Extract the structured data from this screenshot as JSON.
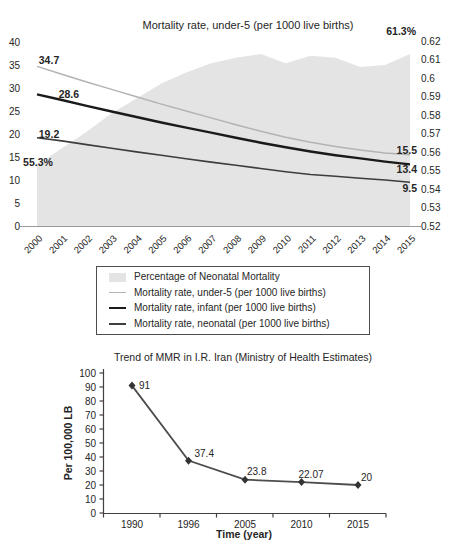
{
  "chart_data": [
    {
      "type": "area",
      "title": "Mortality rate, under-5 (per 1000 live births)",
      "x": [
        "2000",
        "2001",
        "2002",
        "2003",
        "2004",
        "2005",
        "2006",
        "2007",
        "2008",
        "2009",
        "2010",
        "2011",
        "2012",
        "2013",
        "2014",
        "2015"
      ],
      "left_axis": {
        "min": 0,
        "max": 40,
        "ticks": [
          "0",
          "5",
          "10",
          "15",
          "20",
          "25",
          "30",
          "35",
          "40"
        ]
      },
      "right_axis": {
        "min": 0.52,
        "max": 0.62,
        "ticks": [
          "0.52",
          "0.53",
          "0.54",
          "0.55",
          "0.56",
          "0.57",
          "0.58",
          "0.59",
          "0.6",
          "0.61",
          "0.62"
        ]
      },
      "grid": false,
      "area_series": {
        "name": "Percentage of Neonatal Mortality",
        "axis": "right",
        "color": "#e4e4e4",
        "values": [
          0.553,
          0.562,
          0.571,
          0.581,
          0.589,
          0.597,
          0.603,
          0.608,
          0.611,
          0.613,
          0.608,
          0.612,
          0.611,
          0.606,
          0.607,
          0.613
        ],
        "start_label": "55.3%",
        "end_label": "61.3%"
      },
      "line_series": [
        {
          "name": "Mortality rate, under-5 (per 1000 live births)",
          "axis": "left",
          "color": "#b3b3b3",
          "width": 1.5,
          "values": [
            34.7,
            33.0,
            31.3,
            29.7,
            28.1,
            26.5,
            25.0,
            23.5,
            22.0,
            20.6,
            19.3,
            18.2,
            17.3,
            16.5,
            15.9,
            15.5
          ],
          "start_label": "34.7",
          "end_label": "15.5"
        },
        {
          "name": "Mortality rate, infant (per 1000 live births)",
          "axis": "left",
          "color": "#1a1a1a",
          "width": 2.4,
          "values": [
            28.6,
            27.4,
            26.1,
            24.9,
            23.7,
            22.5,
            21.4,
            20.3,
            19.2,
            18.1,
            17.1,
            16.2,
            15.4,
            14.7,
            14.0,
            13.4
          ],
          "start_label": "28.6",
          "end_label": "13.4"
        },
        {
          "name": "Mortality rate, neonatal (per 1000 live births)",
          "axis": "left",
          "color": "#3d3d3d",
          "width": 1.6,
          "values": [
            19.2,
            18.5,
            17.7,
            16.9,
            16.1,
            15.4,
            14.6,
            13.9,
            13.2,
            12.5,
            11.8,
            11.2,
            10.8,
            10.4,
            10.0,
            9.5
          ],
          "start_label": "19.2",
          "end_label": "9.5"
        }
      ],
      "legend": {
        "position": "bottom",
        "items": [
          {
            "label": "Percentage of Neonatal Mortality",
            "swatch": "area",
            "color": "#e4e4e4"
          },
          {
            "label": "Mortality rate, under-5 (per 1000 live births)",
            "swatch": "line",
            "color": "#b3b3b3",
            "line_width": 1.5
          },
          {
            "label": "Mortality rate, infant (per 1000 live births)",
            "swatch": "line",
            "color": "#1a1a1a",
            "line_width": 2.5
          },
          {
            "label": "Mortality rate, neonatal (per 1000 live births)",
            "swatch": "line",
            "color": "#3d3d3d",
            "line_width": 2
          }
        ]
      }
    },
    {
      "type": "line",
      "title": "Trend of MMR in I.R. Iran (Ministry of Health Estimates)",
      "categories": [
        "1990",
        "1996",
        "2005",
        "2010",
        "2015"
      ],
      "values": [
        91,
        37.4,
        23.8,
        22.07,
        20
      ],
      "point_labels": [
        "91",
        "37.4",
        "23.8",
        "22.07",
        "20"
      ],
      "xlabel": "Time (year)",
      "ylabel": "Per 100,000 LB",
      "ylim": [
        0,
        100
      ],
      "yticks": [
        "0",
        "10",
        "20",
        "30",
        "40",
        "50",
        "60",
        "70",
        "80",
        "90",
        "100"
      ],
      "grid": false,
      "marker": "diamond",
      "marker_color": "#333333",
      "line_color": "#4d4d4d",
      "axis_color": "#404040"
    }
  ]
}
